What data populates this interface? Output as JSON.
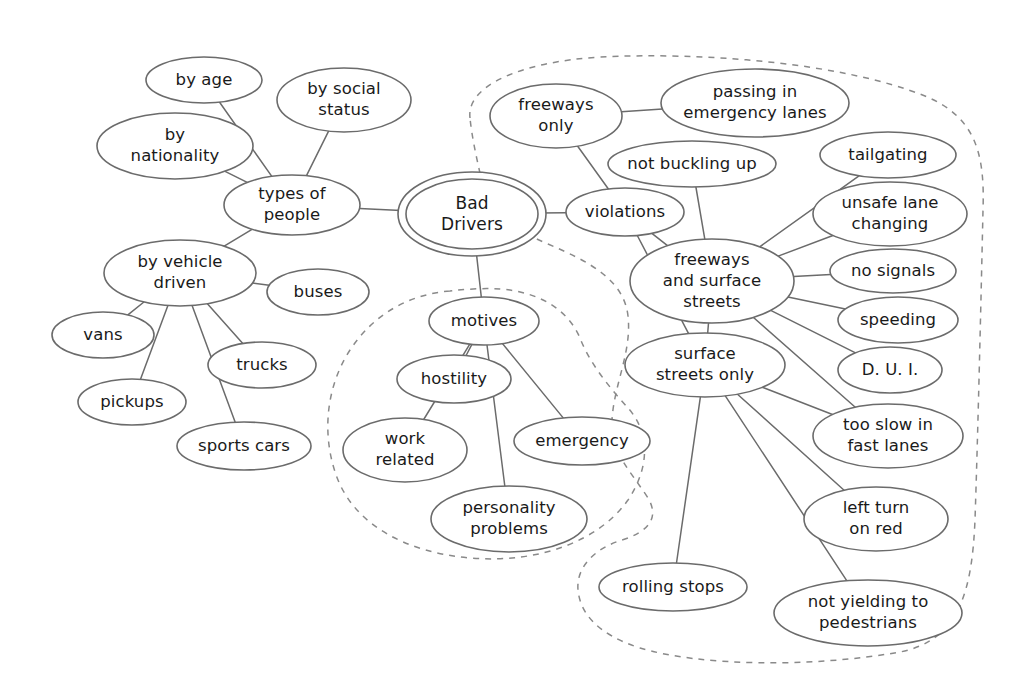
{
  "diagram": {
    "type": "mind-map",
    "stroke_color": "#6b6b6b",
    "boundary_color": "#8a8a8a",
    "text_color": "#1a1a1a",
    "background_color": "#ffffff",
    "root": "Bad Drivers",
    "nodes": [
      {
        "id": "bad-drivers",
        "label": "Bad Drivers",
        "cx": 472,
        "cy": 214,
        "rx": 66,
        "ry": 35,
        "double": true,
        "lines": [
          "Bad",
          "Drivers"
        ]
      },
      {
        "id": "types-of-people",
        "label": "types of people",
        "cx": 292,
        "cy": 205,
        "rx": 68,
        "ry": 30,
        "double": false,
        "lines": [
          "types of",
          "people"
        ]
      },
      {
        "id": "by-age",
        "label": "by age",
        "cx": 204,
        "cy": 80,
        "rx": 58,
        "ry": 23,
        "double": false,
        "lines": [
          "by age"
        ]
      },
      {
        "id": "by-social-status",
        "label": "by social status",
        "cx": 344,
        "cy": 100,
        "rx": 67,
        "ry": 32,
        "double": false,
        "lines": [
          "by social",
          "status"
        ]
      },
      {
        "id": "by-nationality",
        "label": "by nationality",
        "cx": 175,
        "cy": 146,
        "rx": 78,
        "ry": 33,
        "double": false,
        "lines": [
          "by",
          "nationality"
        ]
      },
      {
        "id": "by-vehicle-driven",
        "label": "by vehicle driven",
        "cx": 180,
        "cy": 273,
        "rx": 76,
        "ry": 33,
        "double": false,
        "lines": [
          "by vehicle",
          "driven"
        ]
      },
      {
        "id": "buses",
        "label": "buses",
        "cx": 318,
        "cy": 292,
        "rx": 51,
        "ry": 23,
        "double": false,
        "lines": [
          "buses"
        ]
      },
      {
        "id": "vans",
        "label": "vans",
        "cx": 103,
        "cy": 335,
        "rx": 51,
        "ry": 23,
        "double": false,
        "lines": [
          "vans"
        ]
      },
      {
        "id": "pickups",
        "label": "pickups",
        "cx": 132,
        "cy": 402,
        "rx": 54,
        "ry": 23,
        "double": false,
        "lines": [
          "pickups"
        ]
      },
      {
        "id": "trucks",
        "label": "trucks",
        "cx": 262,
        "cy": 365,
        "rx": 54,
        "ry": 23,
        "double": false,
        "lines": [
          "trucks"
        ]
      },
      {
        "id": "sports-cars",
        "label": "sports cars",
        "cx": 244,
        "cy": 446,
        "rx": 67,
        "ry": 24,
        "double": false,
        "lines": [
          "sports cars"
        ]
      },
      {
        "id": "motives",
        "label": "motives",
        "cx": 484,
        "cy": 321,
        "rx": 55,
        "ry": 24,
        "double": false,
        "lines": [
          "motives"
        ]
      },
      {
        "id": "hostility",
        "label": "hostility",
        "cx": 454,
        "cy": 379,
        "rx": 57,
        "ry": 24,
        "double": false,
        "lines": [
          "hostility"
        ]
      },
      {
        "id": "work-related",
        "label": "work related",
        "cx": 405,
        "cy": 450,
        "rx": 62,
        "ry": 32,
        "double": false,
        "lines": [
          "work",
          "related"
        ]
      },
      {
        "id": "emergency",
        "label": "emergency",
        "cx": 582,
        "cy": 441,
        "rx": 68,
        "ry": 24,
        "double": false,
        "lines": [
          "emergency"
        ]
      },
      {
        "id": "personality-problems",
        "label": "personality problems",
        "cx": 509,
        "cy": 519,
        "rx": 78,
        "ry": 33,
        "double": false,
        "lines": [
          "personality",
          "problems"
        ]
      },
      {
        "id": "violations",
        "label": "violations",
        "cx": 625,
        "cy": 212,
        "rx": 59,
        "ry": 24,
        "double": false,
        "lines": [
          "violations"
        ]
      },
      {
        "id": "freeways-only",
        "label": "freeways only",
        "cx": 556,
        "cy": 116,
        "rx": 66,
        "ry": 32,
        "double": false,
        "lines": [
          "freeways",
          "only"
        ]
      },
      {
        "id": "passing-emergency-lanes",
        "label": "passing in emergency lanes",
        "cx": 755,
        "cy": 103,
        "rx": 94,
        "ry": 34,
        "double": false,
        "lines": [
          "passing in",
          "emergency lanes"
        ]
      },
      {
        "id": "not-buckling-up",
        "label": "not buckling up",
        "cx": 692,
        "cy": 164,
        "rx": 84,
        "ry": 23,
        "double": false,
        "lines": [
          "not buckling up"
        ]
      },
      {
        "id": "freeways-and-surface",
        "label": "freeways and surface streets",
        "cx": 712,
        "cy": 281,
        "rx": 82,
        "ry": 42,
        "double": false,
        "lines": [
          "freeways",
          "and surface",
          "streets"
        ]
      },
      {
        "id": "tailgating",
        "label": "tailgating",
        "cx": 888,
        "cy": 155,
        "rx": 68,
        "ry": 23,
        "double": false,
        "lines": [
          "tailgating"
        ]
      },
      {
        "id": "unsafe-lane-changing",
        "label": "unsafe lane changing",
        "cx": 890,
        "cy": 214,
        "rx": 77,
        "ry": 32,
        "double": false,
        "lines": [
          "unsafe lane",
          "changing"
        ]
      },
      {
        "id": "no-signals",
        "label": "no signals",
        "cx": 893,
        "cy": 271,
        "rx": 63,
        "ry": 22,
        "double": false,
        "lines": [
          "no signals"
        ]
      },
      {
        "id": "speeding",
        "label": "speeding",
        "cx": 898,
        "cy": 320,
        "rx": 60,
        "ry": 23,
        "double": false,
        "lines": [
          "speeding"
        ]
      },
      {
        "id": "dui",
        "label": "D. U. I.",
        "cx": 890,
        "cy": 370,
        "rx": 52,
        "ry": 23,
        "double": false,
        "lines": [
          "D. U. I."
        ]
      },
      {
        "id": "surface-streets-only",
        "label": "surface streets only",
        "cx": 705,
        "cy": 365,
        "rx": 80,
        "ry": 32,
        "double": false,
        "lines": [
          "surface",
          "streets only"
        ]
      },
      {
        "id": "too-slow-fast-lanes",
        "label": "too slow in fast lanes",
        "cx": 888,
        "cy": 436,
        "rx": 75,
        "ry": 32,
        "double": false,
        "lines": [
          "too slow in",
          "fast lanes"
        ]
      },
      {
        "id": "left-turn-on-red",
        "label": "left turn on red",
        "cx": 876,
        "cy": 519,
        "rx": 72,
        "ry": 32,
        "double": false,
        "lines": [
          "left turn",
          "on red"
        ]
      },
      {
        "id": "rolling-stops",
        "label": "rolling stops",
        "cx": 673,
        "cy": 587,
        "rx": 74,
        "ry": 24,
        "double": false,
        "lines": [
          "rolling stops"
        ]
      },
      {
        "id": "not-yielding-pedestrians",
        "label": "not yielding to pedestrians",
        "cx": 868,
        "cy": 613,
        "rx": 94,
        "ry": 33,
        "double": false,
        "lines": [
          "not yielding to",
          "pedestrians"
        ]
      }
    ],
    "edges": [
      {
        "from": "types-of-people",
        "to": "bad-drivers"
      },
      {
        "from": "by-age",
        "to": "types-of-people"
      },
      {
        "from": "by-social-status",
        "to": "types-of-people"
      },
      {
        "from": "by-nationality",
        "to": "types-of-people"
      },
      {
        "from": "by-vehicle-driven",
        "to": "types-of-people"
      },
      {
        "from": "buses",
        "to": "by-vehicle-driven"
      },
      {
        "from": "vans",
        "to": "by-vehicle-driven"
      },
      {
        "from": "pickups",
        "to": "by-vehicle-driven"
      },
      {
        "from": "trucks",
        "to": "by-vehicle-driven"
      },
      {
        "from": "sports-cars",
        "to": "by-vehicle-driven"
      },
      {
        "from": "bad-drivers",
        "to": "motives"
      },
      {
        "from": "motives",
        "to": "hostility"
      },
      {
        "from": "motives",
        "to": "work-related"
      },
      {
        "from": "motives",
        "to": "emergency"
      },
      {
        "from": "motives",
        "to": "personality-problems"
      },
      {
        "from": "bad-drivers",
        "to": "violations"
      },
      {
        "from": "violations",
        "to": "freeways-only"
      },
      {
        "from": "freeways-only",
        "to": "passing-emergency-lanes"
      },
      {
        "from": "violations",
        "to": "freeways-and-surface"
      },
      {
        "from": "not-buckling-up",
        "to": "freeways-and-surface"
      },
      {
        "from": "freeways-and-surface",
        "to": "tailgating"
      },
      {
        "from": "freeways-and-surface",
        "to": "unsafe-lane-changing"
      },
      {
        "from": "freeways-and-surface",
        "to": "no-signals"
      },
      {
        "from": "freeways-and-surface",
        "to": "speeding"
      },
      {
        "from": "freeways-and-surface",
        "to": "dui"
      },
      {
        "from": "freeways-and-surface",
        "to": "too-slow-fast-lanes"
      },
      {
        "from": "violations",
        "to": "surface-streets-only"
      },
      {
        "from": "freeways-and-surface",
        "to": "surface-streets-only"
      },
      {
        "from": "surface-streets-only",
        "to": "left-turn-on-red"
      },
      {
        "from": "surface-streets-only",
        "to": "rolling-stops"
      },
      {
        "from": "surface-streets-only",
        "to": "not-yielding-pedestrians"
      },
      {
        "from": "surface-streets-only",
        "to": "too-slow-fast-lanes"
      }
    ],
    "boundaries": [
      {
        "id": "violations-boundary",
        "name": "violations-region-boundary",
        "d": "M 470 118 C 466 86, 520 62, 600 57 C 700 52, 840 62, 925 96 C 975 117, 985 152, 983 210 C 981 300, 978 430, 975 520 C 972 590, 960 640, 900 652 C 810 668, 700 666, 640 648 C 596 634, 580 612, 578 590 C 576 566, 596 548, 622 540 C 648 532, 660 518, 648 498 C 630 470, 610 452, 612 420 C 614 384, 632 352, 628 316 C 624 280, 590 262, 548 244 C 512 229, 488 208, 482 182 C 477 160, 472 138, 470 118 Z"
      },
      {
        "id": "motives-boundary",
        "name": "motives-region-boundary",
        "d": "M 450 291 C 412 294, 375 312, 350 350 C 324 390, 322 440, 338 480 C 356 524, 404 552, 470 558 C 540 564, 600 540, 628 500 C 652 464, 648 430, 628 408 C 610 388, 590 364, 580 338 C 568 310, 540 292, 500 289 C 484 288, 466 289, 450 291 Z"
      }
    ]
  }
}
